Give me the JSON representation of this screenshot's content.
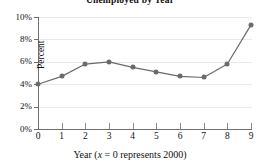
{
  "chart_data": {
    "type": "line",
    "title": "Unemployed by Year",
    "xlabel_prefix": "Year (",
    "xlabel_var": "x",
    "xlabel_suffix": " = 0 represents 2000)",
    "xlabel_full": "Year (x = 0 represents 2000)",
    "ylabel": "Percent",
    "x": [
      0,
      1,
      2,
      3,
      4,
      5,
      6,
      7,
      8,
      9
    ],
    "values": [
      4.0,
      4.7,
      5.8,
      6.0,
      5.5,
      5.1,
      4.7,
      4.6,
      5.8,
      9.3
    ],
    "xticklabels": [
      "0",
      "1",
      "2",
      "3",
      "4",
      "5",
      "6",
      "7",
      "8",
      "9"
    ],
    "yticklabels": [
      "0%",
      "2%",
      "4%",
      "6%",
      "8%",
      "10%"
    ],
    "ytickvalues": [
      0,
      2,
      4,
      6,
      8,
      10
    ],
    "xlim": [
      0,
      9
    ],
    "ylim": [
      0,
      10
    ],
    "grid": "horizontal",
    "legend": "none",
    "series_color": "#6b6b6b",
    "grid_color": "#e9e9e9",
    "axis_color": "#6f6f6f"
  }
}
